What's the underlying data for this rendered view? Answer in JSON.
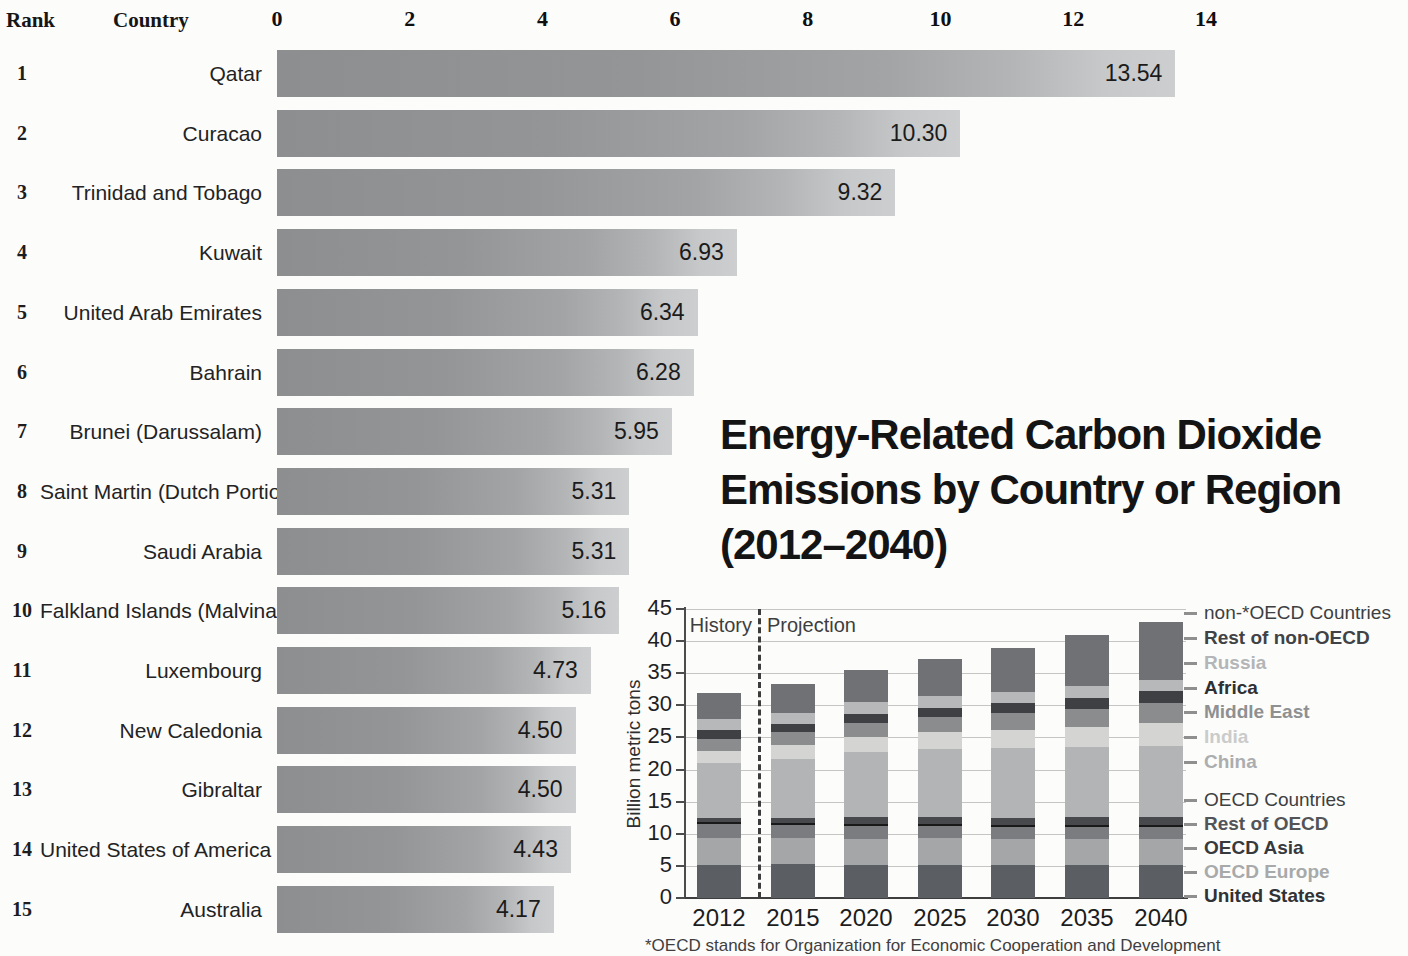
{
  "chart_data": [
    {
      "type": "bar",
      "orientation": "horizontal",
      "column_headers": [
        "Rank",
        "Country"
      ],
      "ranks": [
        "1",
        "2",
        "3",
        "4",
        "5",
        "6",
        "7",
        "8",
        "9",
        "10",
        "11",
        "12",
        "13",
        "14",
        "15"
      ],
      "categories": [
        "Qatar",
        "Curacao",
        "Trinidad and Tobago",
        "Kuwait",
        "United Arab Emirates",
        "Bahrain",
        "Brunei (Darussalam)",
        "Saint Martin (Dutch Portion)",
        "Saudi Arabia",
        "Falkland Islands (Malvinas)",
        "Luxembourg",
        "New Caledonia",
        "Gibraltar",
        "United States of America",
        "Australia"
      ],
      "values": [
        13.54,
        10.3,
        9.32,
        6.93,
        6.34,
        6.28,
        5.95,
        5.31,
        5.31,
        5.16,
        4.73,
        4.5,
        4.5,
        4.43,
        4.17
      ],
      "value_labels": [
        "13.54",
        "10.30",
        "9.32",
        "6.93",
        "6.34",
        "6.28",
        "5.95",
        "5.31",
        "5.31",
        "5.16",
        "4.73",
        "4.50",
        "4.50",
        "4.43",
        "4.17"
      ],
      "xlim": [
        0,
        14
      ],
      "x_ticks": [
        0,
        2,
        4,
        6,
        8,
        10,
        12,
        14
      ],
      "bar_color_left": "#8c8e90",
      "bar_color_right": "#cccecf"
    },
    {
      "type": "bar",
      "stacked": true,
      "title": "Energy-Related Carbon Dioxide Emissions by Country or Region (2012–2040)",
      "title_lines": [
        "Energy-Related Carbon Dioxide",
        "Emissions by Country or Region",
        "(2012–2040)"
      ],
      "ylabel": "Billion metric tons",
      "ylim": [
        0,
        45
      ],
      "y_ticks": [
        0,
        5,
        10,
        15,
        20,
        25,
        30,
        35,
        40,
        45
      ],
      "grid": true,
      "categories": [
        "2012",
        "2015",
        "2020",
        "2025",
        "2030",
        "2035",
        "2040"
      ],
      "annotations": [
        "History",
        "Projection"
      ],
      "divider_between": [
        "2012",
        "2015"
      ],
      "series": [
        {
          "name": "United States",
          "color": "#5b5e62",
          "values": [
            5.2,
            5.3,
            5.1,
            5.1,
            5.1,
            5.1,
            5.2
          ]
        },
        {
          "name": "OECD Europe",
          "color": "#a4a6a8",
          "values": [
            4.2,
            4.0,
            4.1,
            4.2,
            4.1,
            4.1,
            4.0
          ]
        },
        {
          "name": "OECD Asia",
          "color": "#7a7c7f",
          "values": [
            2.1,
            2.1,
            2.0,
            1.9,
            1.9,
            1.9,
            1.9
          ]
        },
        {
          "name": "Rest of OECD",
          "color": "#47494c",
          "values": [
            0.9,
            1.1,
            1.4,
            1.4,
            1.4,
            1.5,
            1.5
          ]
        },
        {
          "name": "China",
          "color": "#b2b4b5",
          "values": [
            8.6,
            9.2,
            10.1,
            10.6,
            10.8,
            10.9,
            11.1
          ]
        },
        {
          "name": "India",
          "color": "#d4d5d3",
          "values": [
            1.9,
            2.1,
            2.3,
            2.6,
            2.9,
            3.2,
            3.6
          ]
        },
        {
          "name": "Middle East",
          "color": "#8a8c8e",
          "values": [
            1.9,
            2.0,
            2.3,
            2.4,
            2.6,
            2.8,
            3.0
          ]
        },
        {
          "name": "Africa",
          "color": "#3e4043",
          "values": [
            1.3,
            1.3,
            1.4,
            1.4,
            1.5,
            1.7,
            1.9
          ]
        },
        {
          "name": "Russia",
          "color": "#b6b8b9",
          "values": [
            1.7,
            1.7,
            1.8,
            1.8,
            1.8,
            1.8,
            1.8
          ]
        },
        {
          "name": "Rest of non-OECD",
          "color": "#6f7174",
          "values": [
            4.1,
            4.6,
            5.0,
            5.8,
            6.9,
            8.0,
            9.0
          ]
        }
      ],
      "totals": [
        31.9,
        33.4,
        35.5,
        37.2,
        39.0,
        41.0,
        43.0
      ],
      "legend_position": "right",
      "legend": [
        {
          "label": "non-*OECD Countries",
          "color": "#3d3f41",
          "bold": false
        },
        {
          "label": "Rest of non-OECD",
          "color": "#404245",
          "bold": true
        },
        {
          "label": "Russia",
          "color": "#b3b5b6",
          "bold": true
        },
        {
          "label": "Africa",
          "color": "#2e3033",
          "bold": true
        },
        {
          "label": "Middle East",
          "color": "#8e9092",
          "bold": true
        },
        {
          "label": "India",
          "color": "#cacccb",
          "bold": true
        },
        {
          "label": "China",
          "color": "#abadae",
          "bold": true
        },
        {
          "label": "OECD Countries",
          "color": "#3d3f41",
          "bold": false
        },
        {
          "label": "Rest of OECD",
          "color": "#525457",
          "bold": true
        },
        {
          "label": "OECD Asia",
          "color": "#37393c",
          "bold": true
        },
        {
          "label": "OECD Europe",
          "color": "#a7a9aa",
          "bold": true
        },
        {
          "label": "United States",
          "color": "#303235",
          "bold": true
        }
      ],
      "footnote": "*OECD stands for Organization for Economic Cooperation and Development"
    }
  ]
}
